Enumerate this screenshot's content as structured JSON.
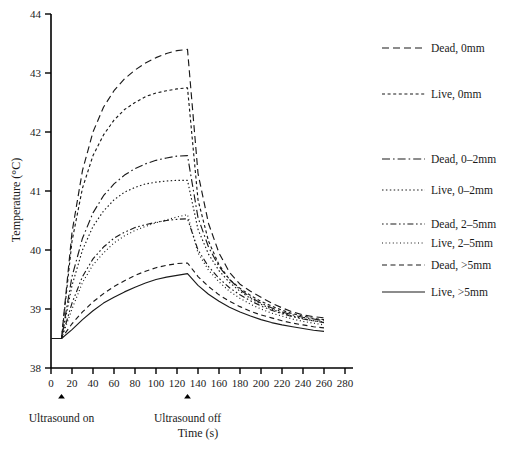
{
  "chart_data": {
    "type": "line",
    "title": "",
    "xlabel": "Time (s)",
    "ylabel": "Temperature (°C)",
    "xlim": [
      0,
      280
    ],
    "ylim": [
      38,
      44
    ],
    "xticks": [
      0,
      20,
      40,
      60,
      80,
      100,
      120,
      140,
      160,
      180,
      200,
      220,
      240,
      260,
      280
    ],
    "yticks": [
      38,
      39,
      40,
      41,
      42,
      43,
      44
    ],
    "grid": false,
    "legend_position": "right",
    "baseline_temperature": 38.5,
    "ultrasound_on_time": 10,
    "ultrasound_off_time": 130,
    "annotations": [
      {
        "label": "Ultrasound on",
        "x": 10,
        "marker": "up-arrow"
      },
      {
        "label": "Ultrasound off",
        "x": 130,
        "marker": "up-arrow"
      }
    ],
    "series": [
      {
        "name": "Dead, 0mm",
        "style": "dashed-long",
        "x": [
          0,
          10,
          20,
          30,
          40,
          50,
          60,
          70,
          80,
          90,
          100,
          110,
          120,
          130,
          140,
          150,
          160,
          170,
          180,
          190,
          200,
          210,
          220,
          230,
          240,
          250,
          260
        ],
        "y": [
          38.5,
          38.5,
          40.3,
          41.35,
          42.0,
          42.42,
          42.7,
          42.9,
          43.05,
          43.17,
          43.26,
          43.33,
          43.38,
          43.4,
          41.3,
          40.45,
          39.95,
          39.62,
          39.42,
          39.3,
          39.2,
          39.1,
          39.02,
          38.95,
          38.9,
          38.87,
          38.85
        ]
      },
      {
        "name": "Live, 0mm",
        "style": "dashed-short",
        "x": [
          0,
          10,
          20,
          30,
          40,
          50,
          60,
          70,
          80,
          90,
          100,
          110,
          120,
          130,
          140,
          150,
          160,
          170,
          180,
          190,
          200,
          210,
          220,
          230,
          240,
          250,
          260
        ],
        "y": [
          38.5,
          38.5,
          40.15,
          41.05,
          41.6,
          41.95,
          42.2,
          42.38,
          42.5,
          42.6,
          42.66,
          42.7,
          42.73,
          42.75,
          40.85,
          40.15,
          39.75,
          39.5,
          39.35,
          39.23,
          39.13,
          39.05,
          38.98,
          38.92,
          38.88,
          38.84,
          38.82
        ]
      },
      {
        "name": "Dead, 0–2mm",
        "style": "dash-dot-long",
        "x": [
          0,
          10,
          20,
          30,
          40,
          50,
          60,
          70,
          80,
          90,
          100,
          110,
          120,
          130,
          140,
          150,
          160,
          170,
          180,
          190,
          200,
          210,
          220,
          230,
          240,
          250,
          260
        ],
        "y": [
          38.5,
          38.5,
          39.55,
          40.2,
          40.63,
          40.92,
          41.12,
          41.27,
          41.38,
          41.46,
          41.52,
          41.56,
          41.59,
          41.6,
          40.55,
          40.05,
          39.72,
          39.5,
          39.33,
          39.2,
          39.1,
          39.02,
          38.95,
          38.9,
          38.86,
          38.83,
          38.8
        ]
      },
      {
        "name": "Live, 0–2mm",
        "style": "dotted-fine",
        "x": [
          0,
          10,
          20,
          30,
          40,
          50,
          60,
          70,
          80,
          90,
          100,
          110,
          120,
          130,
          140,
          150,
          160,
          170,
          180,
          190,
          200,
          210,
          220,
          230,
          240,
          250,
          260
        ],
        "y": [
          38.5,
          38.5,
          39.4,
          40.0,
          40.4,
          40.66,
          40.85,
          40.98,
          41.06,
          41.12,
          41.15,
          41.17,
          41.18,
          41.18,
          40.35,
          39.93,
          39.65,
          39.45,
          39.3,
          39.18,
          39.08,
          39.0,
          38.93,
          38.88,
          38.84,
          38.8,
          38.78
        ]
      },
      {
        "name": "Dead, 2–5mm",
        "style": "dash-dot",
        "x": [
          0,
          10,
          20,
          30,
          40,
          50,
          60,
          70,
          80,
          90,
          100,
          110,
          120,
          130,
          140,
          150,
          160,
          170,
          180,
          190,
          200,
          210,
          220,
          230,
          240,
          250,
          260
        ],
        "y": [
          38.5,
          38.5,
          39.1,
          39.55,
          39.85,
          40.05,
          40.2,
          40.3,
          40.38,
          40.43,
          40.47,
          40.5,
          40.52,
          40.53,
          40.0,
          39.72,
          39.52,
          39.36,
          39.24,
          39.14,
          39.05,
          38.98,
          38.92,
          38.87,
          38.83,
          38.8,
          38.77
        ]
      },
      {
        "name": "Live, 2–5mm",
        "style": "dotted-sparse",
        "x": [
          0,
          10,
          20,
          30,
          40,
          50,
          60,
          70,
          80,
          90,
          100,
          110,
          120,
          130,
          140,
          150,
          160,
          170,
          180,
          190,
          200,
          210,
          220,
          230,
          240,
          250,
          260
        ],
        "y": [
          38.5,
          38.5,
          39.0,
          39.45,
          39.75,
          39.95,
          40.12,
          40.24,
          40.33,
          40.4,
          40.46,
          40.51,
          40.56,
          40.6,
          39.95,
          39.66,
          39.46,
          39.3,
          39.18,
          39.08,
          39.0,
          38.93,
          38.88,
          38.83,
          38.79,
          38.76,
          38.73
        ]
      },
      {
        "name": "Dead, >5mm",
        "style": "dashed-medium",
        "x": [
          0,
          10,
          20,
          30,
          40,
          50,
          60,
          70,
          80,
          90,
          100,
          110,
          120,
          130,
          140,
          150,
          160,
          170,
          180,
          190,
          200,
          210,
          220,
          230,
          240,
          250,
          260
        ],
        "y": [
          38.5,
          38.5,
          38.75,
          38.95,
          39.12,
          39.26,
          39.38,
          39.48,
          39.57,
          39.64,
          39.7,
          39.74,
          39.77,
          39.78,
          39.55,
          39.38,
          39.24,
          39.13,
          39.04,
          38.96,
          38.9,
          38.85,
          38.8,
          38.76,
          38.73,
          38.7,
          38.68
        ]
      },
      {
        "name": "Live, >5mm",
        "style": "solid",
        "x": [
          0,
          10,
          20,
          30,
          40,
          50,
          60,
          70,
          80,
          90,
          100,
          110,
          120,
          130,
          140,
          150,
          160,
          170,
          180,
          190,
          200,
          210,
          220,
          230,
          240,
          250,
          260
        ],
        "y": [
          38.5,
          38.5,
          38.65,
          38.82,
          38.97,
          39.1,
          39.2,
          39.29,
          39.37,
          39.44,
          39.5,
          39.54,
          39.57,
          39.6,
          39.4,
          39.25,
          39.13,
          39.03,
          38.95,
          38.88,
          38.82,
          38.77,
          38.73,
          38.7,
          38.67,
          38.64,
          38.62
        ]
      }
    ]
  },
  "legend": {
    "entries": [
      {
        "label": "Dead, 0mm",
        "style": "dashed-long",
        "y": 48
      },
      {
        "label": "Live, 0mm",
        "style": "dashed-short",
        "y": 94
      },
      {
        "label": "Dead, 0–2mm",
        "style": "dash-dot-long",
        "y": 159
      },
      {
        "label": "Live, 0–2mm",
        "style": "dotted-fine",
        "y": 190
      },
      {
        "label": "Dead, 2–5mm",
        "style": "dash-dot",
        "y": 224
      },
      {
        "label": "Live, 2–5mm",
        "style": "dotted-sparse",
        "y": 243
      },
      {
        "label": "Dead, >5mm",
        "style": "dashed-medium",
        "y": 265
      },
      {
        "label": "Live, >5mm",
        "style": "solid",
        "y": 292
      }
    ]
  }
}
